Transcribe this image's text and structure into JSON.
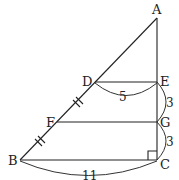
{
  "diagram": {
    "points": {
      "A": {
        "label": "A",
        "x": 157,
        "y": 18
      },
      "D": {
        "label": "D",
        "x": 95,
        "y": 82
      },
      "E": {
        "label": "E",
        "x": 157,
        "y": 82
      },
      "F": {
        "label": "F",
        "x": 57,
        "y": 122
      },
      "G": {
        "label": "G",
        "x": 157,
        "y": 122
      },
      "B": {
        "label": "B",
        "x": 20,
        "y": 160
      },
      "C": {
        "label": "C",
        "x": 157,
        "y": 160
      }
    },
    "measurements": {
      "DE": "5",
      "EG": "3",
      "GC": "3",
      "BC": "11"
    },
    "marks": {
      "equal_segments": [
        "DF",
        "FB"
      ],
      "right_angle_at": "C"
    }
  }
}
